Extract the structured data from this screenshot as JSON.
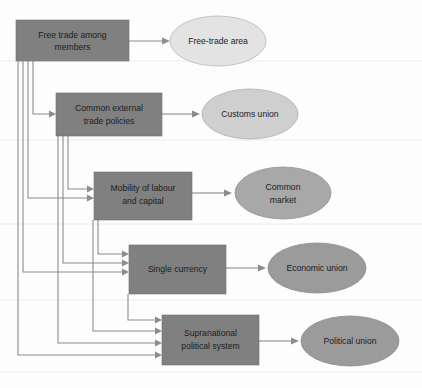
{
  "diagram": {
    "type": "flow-hierarchy",
    "colors": {
      "box_fill": "#808080",
      "connector": "#8c8c8c",
      "ellipse_free_trade_area": "#e3e3e3",
      "ellipse_customs_union": "#cfcfcf",
      "ellipse_common_market": "#a8a8a8",
      "ellipse_economic_union": "#9b9b9b",
      "ellipse_political_union": "#9b9b9b",
      "background": "#fdfdfd"
    },
    "requirement_boxes": [
      {
        "id": "free-trade",
        "label_line1": "Free trade among",
        "label_line2": "members"
      },
      {
        "id": "common-external",
        "label_line1": "Common external",
        "label_line2": "trade policies"
      },
      {
        "id": "mobility",
        "label_line1": "Mobility of labour",
        "label_line2": "and capital"
      },
      {
        "id": "single-currency",
        "label_line1": "Single currency",
        "label_line2": ""
      },
      {
        "id": "supranational",
        "label_line1": "Supranational",
        "label_line2": "political system"
      }
    ],
    "outcome_ellipses": [
      {
        "id": "free-trade-area",
        "label_line1": "Free-trade area",
        "label_line2": ""
      },
      {
        "id": "customs-union",
        "label_line1": "Customs union",
        "label_line2": ""
      },
      {
        "id": "common-market",
        "label_line1": "Common",
        "label_line2": "market"
      },
      {
        "id": "economic-union",
        "label_line1": "Economic union",
        "label_line2": ""
      },
      {
        "id": "political-union",
        "label_line1": "Political union",
        "label_line2": ""
      }
    ]
  }
}
